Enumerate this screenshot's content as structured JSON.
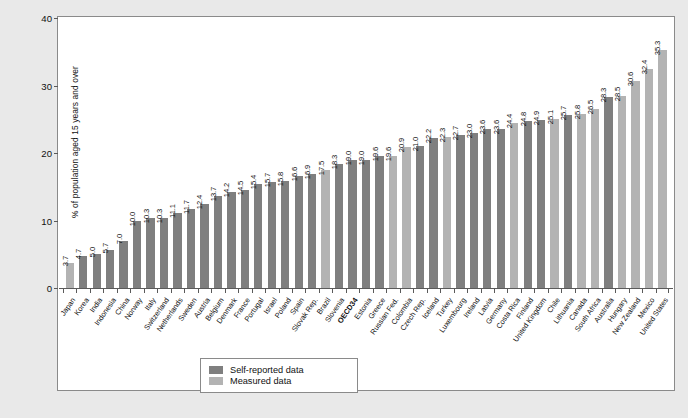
{
  "chart_data": {
    "type": "bar",
    "title": "",
    "xlabel": "",
    "ylabel": "% of population aged 15 years and over",
    "ylim": [
      0,
      40
    ],
    "yticks": [
      "0",
      "10",
      "20",
      "30",
      "40"
    ],
    "grid": false,
    "legend_position": "bottom-center",
    "categories": [
      "Japan",
      "Korea",
      "India",
      "Indonesia",
      "China",
      "Norway",
      "Italy",
      "Switzerland",
      "Netherlands",
      "Sweden",
      "Austria",
      "Belgium",
      "Denmark",
      "France",
      "Portugal",
      "Israel",
      "Poland",
      "Spain",
      "Slovak Rep.",
      "Brazil",
      "Slovenia",
      "OECD34",
      "Estonia",
      "Greece",
      "Russian Fed.",
      "Colombia",
      "Czech Rep.",
      "Iceland",
      "Turkey",
      "Luxembourg",
      "Ireland",
      "Latvia",
      "Germany",
      "Costa Rica",
      "Finland",
      "United Kingdom",
      "Chile",
      "Lithuania",
      "Canada",
      "South Africa",
      "Australia",
      "Hungary",
      "New Zealand",
      "Mexico",
      "United States"
    ],
    "values": [
      3.7,
      4.7,
      5.0,
      5.7,
      7.0,
      10.0,
      10.3,
      10.3,
      11.1,
      11.7,
      12.4,
      13.7,
      14.2,
      14.5,
      15.4,
      15.7,
      15.8,
      16.6,
      16.9,
      17.5,
      18.3,
      19.0,
      19.0,
      19.6,
      19.6,
      20.9,
      21.0,
      22.2,
      22.3,
      22.7,
      23.0,
      23.6,
      23.6,
      24.4,
      24.8,
      24.9,
      25.1,
      25.7,
      25.8,
      26.5,
      28.3,
      28.5,
      30.6,
      32.4,
      35.3
    ],
    "series_type": [
      "measured",
      "self",
      "self",
      "self",
      "self",
      "self",
      "self",
      "self",
      "self",
      "self",
      "self",
      "self",
      "self",
      "self",
      "self",
      "self",
      "self",
      "self",
      "self",
      "measured",
      "self",
      "self",
      "self",
      "self",
      "measured",
      "measured",
      "self",
      "self",
      "measured",
      "self",
      "self",
      "self",
      "self",
      "measured",
      "self",
      "self",
      "measured",
      "self",
      "measured",
      "measured",
      "self",
      "measured",
      "measured",
      "measured",
      "measured"
    ],
    "highlight_category": "OECD34",
    "legend": [
      {
        "key": "self",
        "label": "Self-reported data",
        "color": "#7f7f7f"
      },
      {
        "key": "measured",
        "label": "Measured data",
        "color": "#b3b3b3"
      }
    ]
  },
  "colors": {
    "page_background": "#e9e9e9",
    "plot_background": "#ffffff",
    "axis": "#5a5a5a",
    "self_reported": "#7f7f7f",
    "measured": "#b3b3b3",
    "text": "#111111"
  }
}
